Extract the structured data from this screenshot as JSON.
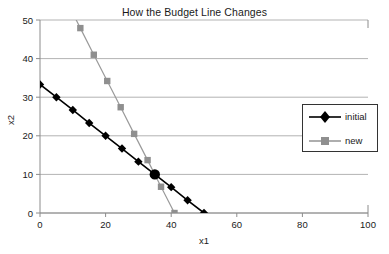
{
  "chart_data": {
    "type": "line",
    "title": "How the Budget Line Changes",
    "xlabel": "x1",
    "ylabel": "x2",
    "xlim": [
      0,
      100
    ],
    "ylim": [
      0,
      50
    ],
    "xticks": [
      0,
      20,
      40,
      60,
      80,
      100
    ],
    "yticks": [
      0,
      10,
      20,
      30,
      40,
      50
    ],
    "grid": "horizontal",
    "legend_position": "right",
    "series": [
      {
        "name": "initial",
        "color": "#000000",
        "marker": "diamond",
        "points": [
          [
            0,
            33.3
          ],
          [
            5,
            30.0
          ],
          [
            10,
            26.7
          ],
          [
            15,
            23.3
          ],
          [
            20,
            20.0
          ],
          [
            25,
            16.7
          ],
          [
            30,
            13.3
          ],
          [
            35,
            10.0
          ],
          [
            40,
            6.7
          ],
          [
            45,
            3.3
          ],
          [
            50,
            0
          ]
        ]
      },
      {
        "name": "new",
        "color": "#9a9a9a",
        "marker": "square",
        "points": [
          [
            8.2,
            54.8
          ],
          [
            12.3,
            47.9
          ],
          [
            16.4,
            41.0
          ],
          [
            20.5,
            34.2
          ],
          [
            24.6,
            27.4
          ],
          [
            28.7,
            20.5
          ],
          [
            32.8,
            13.7
          ],
          [
            36.9,
            6.8
          ],
          [
            41.0,
            0
          ]
        ]
      }
    ],
    "annotations": [
      {
        "label": "intersection",
        "marker": "large-circle",
        "x": 35,
        "y": 10,
        "color": "#000000"
      }
    ]
  },
  "legend": {
    "items": [
      {
        "label": "initial"
      },
      {
        "label": "new"
      }
    ]
  }
}
